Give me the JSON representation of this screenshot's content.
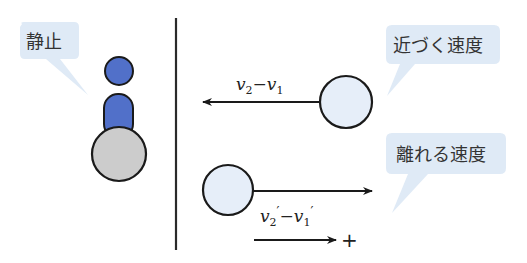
{
  "labels": {
    "stationary": "静止",
    "approach_speed": "近づく速度",
    "separation_speed": "離れる速度"
  },
  "vectors": {
    "approach": {
      "v": "v",
      "sub2": "2",
      "minus": "−",
      "sub1": "1"
    },
    "separation": {
      "v": "v",
      "sub2": "2",
      "prime": "′",
      "minus": "−",
      "sub1": "1"
    },
    "positive_direction": "+"
  },
  "colors": {
    "bubble_fill": "#dfeaf6",
    "person_fill": "#5170c9",
    "gray_ball_fill": "#cccccc",
    "ball_fill": "#e6eef9",
    "stroke": "#1a1a1a"
  }
}
